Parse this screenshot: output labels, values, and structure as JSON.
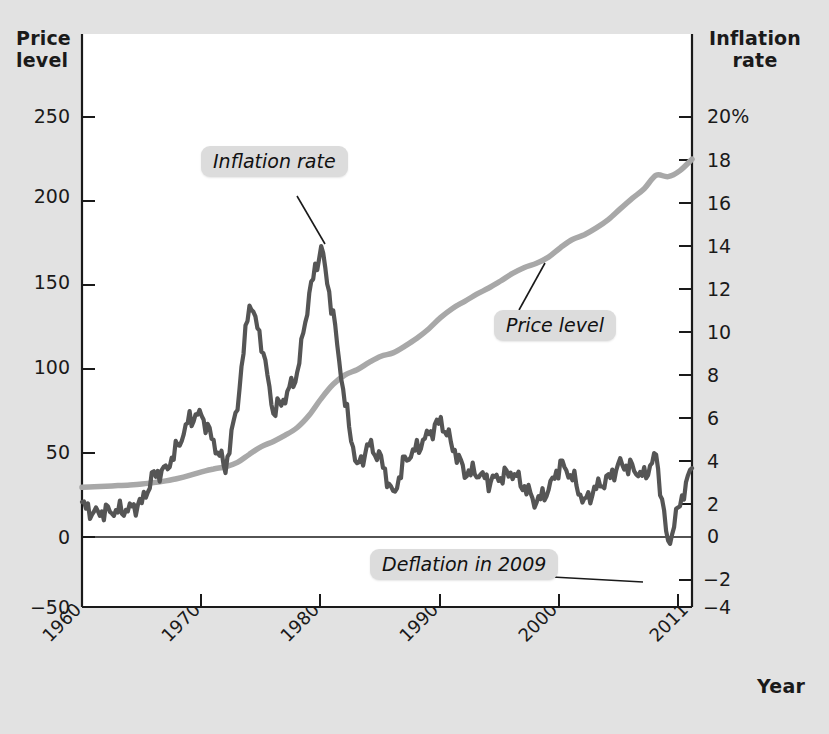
{
  "axes": {
    "left_title": "Price\nlevel",
    "left_title_line1": "Price",
    "left_title_line2": "level",
    "right_title_line1": "Inflation",
    "right_title_line2": "rate",
    "x_title": "Year",
    "left_ticks": [
      "250",
      "200",
      "150",
      "100",
      "50",
      "0",
      "−50"
    ],
    "right_ticks": [
      "20%",
      "18",
      "16",
      "14",
      "12",
      "10",
      "8",
      "6",
      "4",
      "2",
      "0",
      "−2",
      "−4"
    ],
    "x_ticks": [
      "1960",
      "1970",
      "1980",
      "1990",
      "2000",
      "2011"
    ]
  },
  "annotations": {
    "inflation_rate": "Inflation rate",
    "price_level": "Price level",
    "deflation": "Deflation in 2009"
  },
  "colors": {
    "background": "#e2e2e2",
    "plot_background": "#ffffff",
    "price_level_line": "#a8a8a8",
    "inflation_line": "#555555",
    "axis": "#1a1a1a",
    "callout_background": "#dcdcdc",
    "leader_line": "#1a1a1a"
  },
  "chart_data": {
    "type": "line",
    "title": "",
    "subtitle": "",
    "xlabel": "Year",
    "ylabel": "Price level",
    "y2label": "Inflation rate",
    "xlim": [
      1960,
      2011
    ],
    "ylim": [
      -50,
      275
    ],
    "y2lim": [
      -4,
      21
    ],
    "grid": false,
    "legend": "annotations-inline",
    "x": [
      1960,
      1961,
      1962,
      1963,
      1964,
      1965,
      1966,
      1967,
      1968,
      1969,
      1970,
      1971,
      1972,
      1973,
      1974,
      1975,
      1976,
      1977,
      1978,
      1979,
      1980,
      1981,
      1982,
      1983,
      1984,
      1985,
      1986,
      1987,
      1988,
      1989,
      1990,
      1991,
      1992,
      1993,
      1994,
      1995,
      1996,
      1997,
      1998,
      1999,
      2000,
      2001,
      2002,
      2003,
      2004,
      2005,
      2006,
      2007,
      2008,
      2009,
      2010,
      2011
    ],
    "series": [
      {
        "name": "Price level",
        "axis": "left",
        "color": "#a8a8a8",
        "units": "index, 1982-84 = 100",
        "values": [
          29.6,
          29.9,
          30.2,
          30.6,
          31.0,
          31.5,
          32.4,
          33.4,
          34.8,
          36.7,
          38.8,
          40.5,
          41.8,
          44.4,
          49.3,
          53.8,
          56.9,
          60.6,
          65.2,
          72.6,
          82.4,
          90.9,
          96.5,
          99.6,
          103.9,
          107.6,
          109.6,
          113.6,
          118.3,
          124.0,
          130.7,
          136.2,
          140.3,
          144.5,
          148.2,
          152.4,
          156.9,
          160.5,
          163.0,
          166.6,
          172.2,
          177.1,
          179.9,
          184.0,
          188.9,
          195.3,
          201.6,
          207.3,
          215.3,
          214.5,
          218.1,
          224.9
        ]
      },
      {
        "name": "Inflation rate",
        "axis": "right",
        "color": "#555555",
        "units": "percent per year",
        "values": [
          1.5,
          1.1,
          1.2,
          1.2,
          1.3,
          1.6,
          2.9,
          3.1,
          4.2,
          5.5,
          5.7,
          4.4,
          3.2,
          6.2,
          11.0,
          9.1,
          5.8,
          6.5,
          7.6,
          11.3,
          13.5,
          10.3,
          6.2,
          3.2,
          4.3,
          3.6,
          1.9,
          3.6,
          4.1,
          4.8,
          5.4,
          4.2,
          3.0,
          3.0,
          2.6,
          2.8,
          3.0,
          2.3,
          1.6,
          2.2,
          3.4,
          2.8,
          1.6,
          2.3,
          2.7,
          3.4,
          3.2,
          2.8,
          3.8,
          -0.4,
          1.6,
          3.2
        ]
      }
    ],
    "annotations": [
      {
        "text": "Inflation rate",
        "points_to_year": 1980,
        "points_to_value": 14.9
      },
      {
        "text": "Price level",
        "points_to_year": 1995,
        "points_to_value": 152
      },
      {
        "text": "Deflation in 2009",
        "points_to_year": 2009,
        "points_to_value": -2.1
      }
    ]
  }
}
